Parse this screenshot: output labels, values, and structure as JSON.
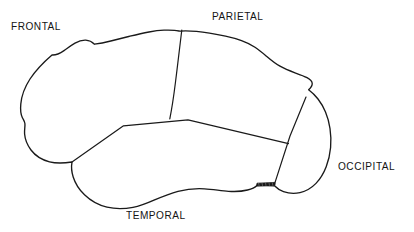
{
  "diagram": {
    "kind": "line-drawing",
    "background_color": "#ffffff",
    "stroke_color": "#1a1a1a",
    "text_color": "#141414",
    "width": 414,
    "height": 232
  },
  "labels": {
    "frontal": "FRONTAL",
    "parietal": "PARIETAL",
    "occipital": "OCCIPITAL",
    "temporal": "TEMPORAL"
  },
  "shapes": {
    "cortex_outline": "M 52.0 55.0 C 45.0 61.0 36.0 70.0 30.0 79.0 C 24.5 87.5 21.5 96.0 20.8 104.0 C 20.2 110.5 21.0 115.0 22.4 117.8 C 23.6 120.2 24.6 121.0 24.9 123.5 C 25.3 126.6 24.2 129.5 24.6 134.0 C 25.0 139.0 27.0 144.6 31.0 150.0 C 35.5 156.0 42.5 160.0 49.5 161.8 C 56.5 163.6 64.0 163.2 72.0 162.0 L 72.0 162.0 C 71.2 166.5 71.6 172.0 73.2 177.0 C 75.2 183.4 79.0 189.5 84.5 194.8 C 90.5 200.6 98.5 205.2 107.0 207.2 C 116.0 209.3 125.5 208.8 133.0 207.4 C 141.0 205.9 147.0 203.3 154.0 200.2 C 161.5 196.9 169.5 193.5 178.0 191.3 C 187.0 189.0 196.0 188.3 204.5 188.8 C 213.0 189.3 221.0 190.8 228.5 191.3 C 235.5 191.8 242.0 191.4 247.5 190.0 C 252.5 188.7 255.8 186.6 257.0 185.4 L 274.5 185.8 C 276.0 187.4 279.0 190.0 283.5 191.6 C 288.5 193.4 294.5 193.8 300.0 192.6 C 306.0 191.3 311.5 188.0 316.0 183.4 C 320.5 178.8 323.8 173.0 326.2 166.8 C 328.6 160.6 330.0 154.0 330.6 147.5 C 331.2 141.0 330.9 134.5 330.0 128.5 C 329.1 122.5 327.6 117.0 325.5 112.0 C 323.4 107.0 320.8 102.6 318.0 99.0 C 315.0 95.2 311.8 92.2 308.6 89.8 C 311.0 87.6 312.4 85.2 312.2 83.2 C 312.0 81.0 310.0 79.2 307.0 77.6 C 303.8 75.9 299.5 74.4 295.0 72.8 C 290.0 71.0 284.8 69.0 280.0 66.2 C 275.0 63.3 270.5 59.6 266.5 56.2 C 262.5 52.8 259.0 49.8 255.0 47.2 C 251.0 44.6 246.5 42.4 241.5 40.6 C 236.5 38.8 231.0 37.4 225.5 36.2 C 220.0 35.0 214.5 34.0 209.5 33.2 C 204.8 32.4 200.5 31.8 196.5 31.4 C 192.5 31.0 188.8 30.8 185.5 30.8 C 183.5 30.8 181.8 30.9 180.5 31.2 C 179.0 31.0 177.0 30.6 174.5 30.4 C 171.5 30.1 168.0 30.0 164.0 30.2 C 159.5 30.4 154.5 31.0 149.0 32.0 C 143.0 33.1 136.5 34.6 130.0 36.2 C 123.5 37.8 117.0 39.5 110.8 41.0 C 105.0 42.4 99.5 43.5 94.5 44.2 C 92.0 41.8 89.0 40.4 85.8 40.2 C 82.3 40.0 78.5 41.2 75.0 43.2 C 71.2 45.4 67.5 48.2 64.0 50.6 C 60.2 53.2 56.2 55.4 52.0 55.0 Z",
    "central_sulcus": "M 181.8 30.0 C 180.6 40.0 178.0 62.0 175.5 82.0 C 173.5 98.0 171.5 110.5 169.8 118.8",
    "lateral_sulcus": "M 72.0 162.0 L 123.5 125.8 L 188.0 119.8 L 288.5 143.6",
    "parieto_occipital_line": "M 306.0 97.0 L 290.0 136.0 L 274.0 185.6",
    "cerebellum_mark": "M 256.5 186.0 L 275.0 185.2 L 275.0 182.4 L 257.0 183.2 Z"
  }
}
